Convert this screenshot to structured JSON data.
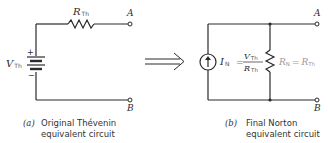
{
  "figure": {
    "left_circuit": {
      "resistor_label": "R",
      "resistor_sub": "Th",
      "source_label": "V",
      "source_sub": "Th",
      "plus": "+",
      "minus": "−",
      "terminal_a": "A",
      "terminal_b": "B",
      "caption_tag": "(a)",
      "caption_line1": "Original Thévenin",
      "caption_line2": "equivalent circuit"
    },
    "arrow": "⟹",
    "right_circuit": {
      "current_label": "I",
      "current_sub": "N",
      "eq_sign": "=",
      "frac_num": "V",
      "frac_num_sub": "Th",
      "frac_den": "R",
      "frac_den_sub": "Th",
      "resistor_label": "R",
      "resistor_sub": "N",
      "resistor_eq": "=",
      "resistor_eq_rhs": "R",
      "resistor_eq_rhs_sub": "Th",
      "terminal_a": "A",
      "terminal_b": "B",
      "caption_tag": "(b)",
      "caption_line1": "Final Norton",
      "caption_line2": "equivalent circuit"
    }
  }
}
